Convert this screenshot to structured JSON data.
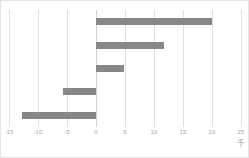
{
  "chart_data": {
    "type": "bar",
    "orientation": "horizontal",
    "title": "",
    "xlabel": "",
    "ylabel": "",
    "unit_label": "千",
    "xlim": [
      -15,
      25
    ],
    "grid": true,
    "legend": false,
    "categories": [
      "1",
      "2",
      "3",
      "4",
      "5"
    ],
    "values": [
      20.0,
      11.8,
      4.8,
      -5.7,
      -12.7
    ],
    "tick_labels": [
      "-15",
      "-10",
      "-5",
      "0",
      "5",
      "10",
      "15",
      "20",
      "25"
    ],
    "tick_values": [
      -15,
      -10,
      -5,
      0,
      5,
      10,
      15,
      20,
      25
    ],
    "bar_color": "#888888",
    "gridline_color": "#e0e0e0",
    "zero_line_color": "#d2d2d2",
    "tick_label_color": "#a6a6a6",
    "background_color": "#ffffff",
    "border_color": "#e4e4e4"
  }
}
